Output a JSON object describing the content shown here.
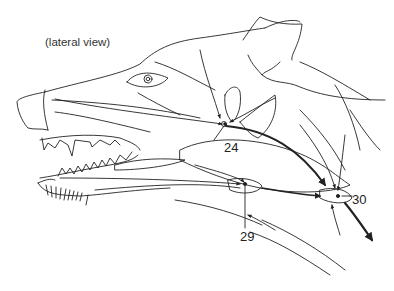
{
  "figure": {
    "view_label": "(lateral view)",
    "labels": [
      {
        "id": "24",
        "text": "24"
      },
      {
        "id": "29",
        "text": "29"
      },
      {
        "id": "30",
        "text": "30"
      }
    ],
    "colors": {
      "line": "#222222",
      "background": "#ffffff"
    }
  }
}
